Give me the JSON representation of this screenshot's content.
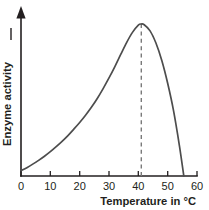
{
  "chart_data": {
    "type": "line",
    "title": "",
    "xlabel": "Temperature in °C",
    "ylabel": "Enzyme activity",
    "xlim": [
      0,
      60
    ],
    "ylim": [
      0,
      1
    ],
    "grid": false,
    "legend": null,
    "xticks": [
      0,
      10,
      20,
      30,
      40,
      50,
      60
    ],
    "xtick_labels": [
      "0",
      "10",
      "20",
      "30",
      "40",
      "50",
      "60"
    ],
    "yticks": [],
    "ytick_labels": [],
    "y_axis_has_numbers": false,
    "y_axis_arrow": true,
    "annotations": [
      {
        "name": "optimum-temperature-dashed-line",
        "type": "vertical-dashed-line",
        "x": 41,
        "label": ""
      }
    ],
    "series": [
      {
        "name": "Enzyme activity",
        "color": "#4d4d4d",
        "x": [
          0,
          2,
          4,
          6,
          8,
          10,
          12,
          14,
          16,
          18,
          20,
          22,
          24,
          26,
          28,
          30,
          32,
          34,
          36,
          38,
          40,
          41,
          42,
          44,
          46,
          48,
          50,
          52,
          54,
          55.5
        ],
        "y": [
          0.035,
          0.055,
          0.078,
          0.103,
          0.13,
          0.16,
          0.193,
          0.228,
          0.266,
          0.308,
          0.352,
          0.4,
          0.452,
          0.51,
          0.575,
          0.645,
          0.72,
          0.8,
          0.878,
          0.945,
          0.993,
          1.0,
          0.995,
          0.955,
          0.875,
          0.76,
          0.61,
          0.43,
          0.2,
          0.0
        ]
      }
    ]
  },
  "axes": {
    "x_label": "Temperature in °C",
    "y_label": "Enzyme activity"
  },
  "ticks": {
    "x": [
      "0",
      "10",
      "20",
      "30",
      "40",
      "50",
      "60"
    ]
  },
  "colors": {
    "curve": "#4d4d4d",
    "axis": "#231f20",
    "dashed_line": "#7a7a7a",
    "background": "#ffffff"
  }
}
